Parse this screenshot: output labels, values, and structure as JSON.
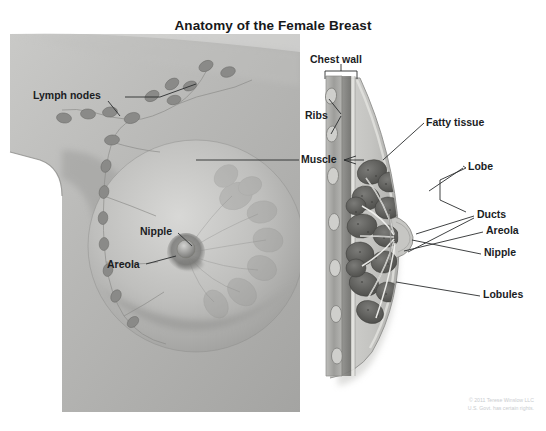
{
  "figure": {
    "title": "Anatomy of the Female Breast",
    "ink_color": "#1b1d1f",
    "line_color": "#2a2c2e",
    "copyright_color": "#c9cccf"
  },
  "left_panel": {
    "name": "external-breast-view",
    "labels": [
      {
        "id": "lymph-nodes",
        "text": "Lymph nodes"
      },
      {
        "id": "nipple",
        "text": "Nipple"
      },
      {
        "id": "areola",
        "text": "Areola"
      }
    ]
  },
  "center_label": {
    "id": "muscle",
    "text": "Muscle"
  },
  "right_panel": {
    "name": "breast-cross-section",
    "labels": [
      {
        "id": "chest-wall",
        "text": "Chest wall"
      },
      {
        "id": "ribs",
        "text": "Ribs"
      },
      {
        "id": "fatty-tissue",
        "text": "Fatty tissue"
      },
      {
        "id": "lobe",
        "text": "Lobe"
      },
      {
        "id": "ducts",
        "text": "Ducts"
      },
      {
        "id": "areola",
        "text": "Areola"
      },
      {
        "id": "nipple",
        "text": "Nipple"
      },
      {
        "id": "lobules",
        "text": "Lobules"
      }
    ]
  },
  "credit": {
    "line1": "© 2011 Terese Winslow LLC",
    "line2": "U.S. Govt. has certain rights."
  }
}
